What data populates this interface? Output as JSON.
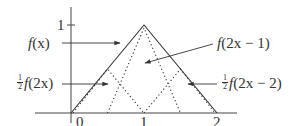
{
  "diagram": {
    "type": "function-decomposition",
    "axes": {
      "x_ticks": [
        {
          "value": 0,
          "label": "0"
        },
        {
          "value": 1,
          "label": "1"
        },
        {
          "value": 2,
          "label": "2"
        }
      ],
      "y_ticks": [
        {
          "value": 1,
          "label": "1"
        }
      ]
    },
    "curves": [
      {
        "name": "f(x)",
        "style": "solid",
        "points": [
          [
            0,
            0
          ],
          [
            1,
            1
          ],
          [
            2,
            0
          ]
        ]
      },
      {
        "name": "1/2 f(2x)",
        "style": "dotted",
        "points": [
          [
            0,
            0
          ],
          [
            0.5,
            0.5
          ],
          [
            1,
            0
          ]
        ]
      },
      {
        "name": "f(2x-1)",
        "style": "dotted",
        "points": [
          [
            0.5,
            0
          ],
          [
            1,
            1
          ],
          [
            1.5,
            0
          ]
        ]
      },
      {
        "name": "1/2 f(2x-2)",
        "style": "dotted",
        "points": [
          [
            1,
            0
          ],
          [
            1.5,
            0.5
          ],
          [
            2,
            0
          ]
        ]
      }
    ],
    "labels": {
      "fx": {
        "fn": "f",
        "arg": "(x)"
      },
      "half_f2x": {
        "num": "1",
        "den": "2",
        "fn": "f",
        "arg": "(2x)"
      },
      "f2x_minus_1": {
        "fn": "f",
        "arg": "(2x − 1)"
      },
      "half_f2x_minus_2": {
        "num": "1",
        "den": "2",
        "fn": "f",
        "arg": "(2x − 2)"
      }
    },
    "colors": {
      "line": "#333333",
      "background": "#ffffff"
    }
  }
}
